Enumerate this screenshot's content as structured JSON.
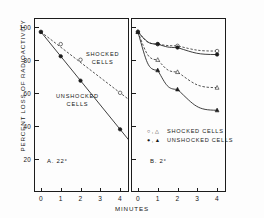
{
  "chart_data": {
    "type": "line",
    "title": "",
    "xlabel": "MINUTES",
    "ylabel": "PERCENT LOSS OF RADIOACTIVITY",
    "grid": false,
    "legend_position": "inside-lower-left (panel B); inline text labels (panel A)",
    "panels": [
      {
        "key": "A. 22°",
        "name": "A",
        "temperature_label": "22°",
        "xlim": [
          -0.35,
          4.45
        ],
        "ylim": [
          8,
          108
        ],
        "xticks": [
          "0",
          "1",
          "2",
          "3",
          "4"
        ],
        "xtick_values": [
          0,
          1,
          2,
          3,
          4
        ],
        "yticks": [
          "20",
          "40",
          "60",
          "80",
          "100"
        ],
        "ytick_values": [
          20,
          40,
          60,
          80,
          100
        ],
        "annotations": [
          {
            "text": "SHOCKED\nCELLS",
            "line1": "SHOCKED",
            "line2": "CELLS"
          },
          {
            "text": "UNSHOCKED\nCELLS",
            "line1": "UNSHOCKED",
            "line2": "CELLS"
          }
        ],
        "series": [
          {
            "name": "SHOCKED CELLS",
            "marker": "open-circle",
            "line": "dashed",
            "x": [
              0,
              1,
              2,
              4
            ],
            "values": [
              100,
              93,
              84,
              65
            ]
          },
          {
            "name": "UNSHOCKED CELLS",
            "marker": "filled-circle",
            "line": "solid",
            "x": [
              0,
              1,
              2,
              4
            ],
            "values": [
              100,
              86,
              72,
              44
            ]
          }
        ]
      },
      {
        "key": "B. 2°",
        "name": "B",
        "temperature_label": "2°",
        "xlim": [
          -0.35,
          4.45
        ],
        "ylim": [
          8,
          108
        ],
        "xticks": [
          "0",
          "1",
          "2",
          "3",
          "4"
        ],
        "xtick_values": [
          0,
          1,
          2,
          3,
          4
        ],
        "yticks": [
          "20",
          "40",
          "60",
          "80",
          "100"
        ],
        "ytick_values": [
          20,
          40,
          60,
          80,
          100
        ],
        "series": [
          {
            "name": "SHOCKED CELLS (circle)",
            "marker": "open-circle",
            "line": "dashed",
            "x": [
              0,
              1,
              2,
              4
            ],
            "values": [
              100,
              93,
              92,
              89
            ]
          },
          {
            "name": "UNSHOCKED CELLS (circle)",
            "marker": "filled-circle",
            "line": "solid",
            "x": [
              0,
              1,
              2,
              4
            ],
            "values": [
              100,
              93,
              91,
              87
            ]
          },
          {
            "name": "SHOCKED CELLS (triangle)",
            "marker": "open-triangle",
            "line": "dashed",
            "x": [
              0,
              1,
              2,
              4
            ],
            "values": [
              100,
              84,
              77,
              68
            ]
          },
          {
            "name": "UNSHOCKED CELLS (triangle)",
            "marker": "filled-triangle",
            "line": "solid",
            "x": [
              0,
              1,
              2,
              4
            ],
            "values": [
              100,
              78,
              67,
              55
            ]
          }
        ],
        "legend": [
          {
            "marks": "○ , △",
            "label": "SHOCKED CELLS"
          },
          {
            "marks": "● , ▲",
            "label": "UNSHOCKED CELLS"
          }
        ]
      }
    ],
    "colors": {
      "ink": "#1c1c1c",
      "background": "#ffffff"
    }
  }
}
